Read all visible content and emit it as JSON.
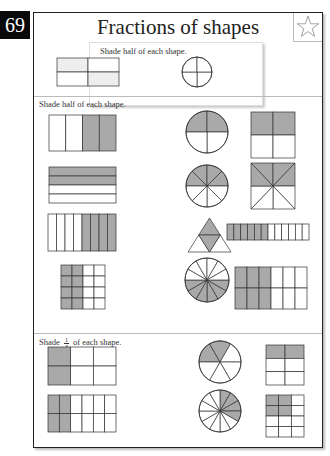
{
  "page_number": "69",
  "title": "Fractions of shapes",
  "icons": {
    "star": "star-icon"
  },
  "colors": {
    "shade": "#a9a9a9",
    "line": "#333333",
    "border": "#222222"
  },
  "example": {
    "instruction": "Shade half of each shape.",
    "shapes": [
      {
        "type": "rect-grid",
        "cols": 2,
        "rows": 2,
        "shaded_cells": [
          0,
          3
        ]
      },
      {
        "type": "circle-sectors",
        "sectors": 4,
        "shaded_sectors": []
      }
    ]
  },
  "section1": {
    "instruction": "Shade half of each shape.",
    "shapes": [
      {
        "type": "rect-grid",
        "cols": 4,
        "rows": 1,
        "fraction_shaded": 0.5
      },
      {
        "type": "circle-sectors",
        "sectors": 4,
        "fraction_shaded": 0.5
      },
      {
        "type": "rect-grid",
        "cols": 2,
        "rows": 2,
        "fraction_shaded": 0.5
      },
      {
        "type": "rect-grid",
        "cols": 1,
        "rows": 4,
        "fraction_shaded": 0.5
      },
      {
        "type": "circle-sectors",
        "sectors": 8,
        "fraction_shaded": 0.5
      },
      {
        "type": "square-diagonals",
        "sectors": 8,
        "fraction_shaded": 0.5
      },
      {
        "type": "rect-grid",
        "cols": 8,
        "rows": 1,
        "fraction_shaded": 0.5
      },
      {
        "type": "triangle",
        "parts": 4,
        "fraction_shaded": 0.5
      },
      {
        "type": "rect-grid",
        "cols": 12,
        "rows": 1,
        "fraction_shaded": 0.5
      },
      {
        "type": "rect-grid",
        "cols": 4,
        "rows": 4,
        "fraction_shaded": 0.5
      },
      {
        "type": "circle-sectors",
        "sectors": 12,
        "fraction_shaded": 0.5
      },
      {
        "type": "rect-grid",
        "cols": 6,
        "rows": 2,
        "fraction_shaded": 0.5
      }
    ]
  },
  "section2": {
    "instruction_prefix": "Shade",
    "fraction_numerator": "1",
    "fraction_denominator": "3",
    "instruction_suffix": "of each shape.",
    "shapes": [
      {
        "type": "rect-grid",
        "cols": 3,
        "rows": 2,
        "fraction_shaded": 0.3333
      },
      {
        "type": "circle-sectors",
        "sectors": 6,
        "fraction_shaded": 0.3333
      },
      {
        "type": "rect-grid",
        "cols": 2,
        "rows": 3,
        "fraction_shaded": 0.3333
      },
      {
        "type": "rect-grid",
        "cols": 6,
        "rows": 2,
        "fraction_shaded": 0.3333
      },
      {
        "type": "circle-sectors",
        "sectors": 12,
        "fraction_shaded": 0.3333
      },
      {
        "type": "rect-grid",
        "cols": 3,
        "rows": 4,
        "fraction_shaded": 0.3333
      }
    ]
  }
}
